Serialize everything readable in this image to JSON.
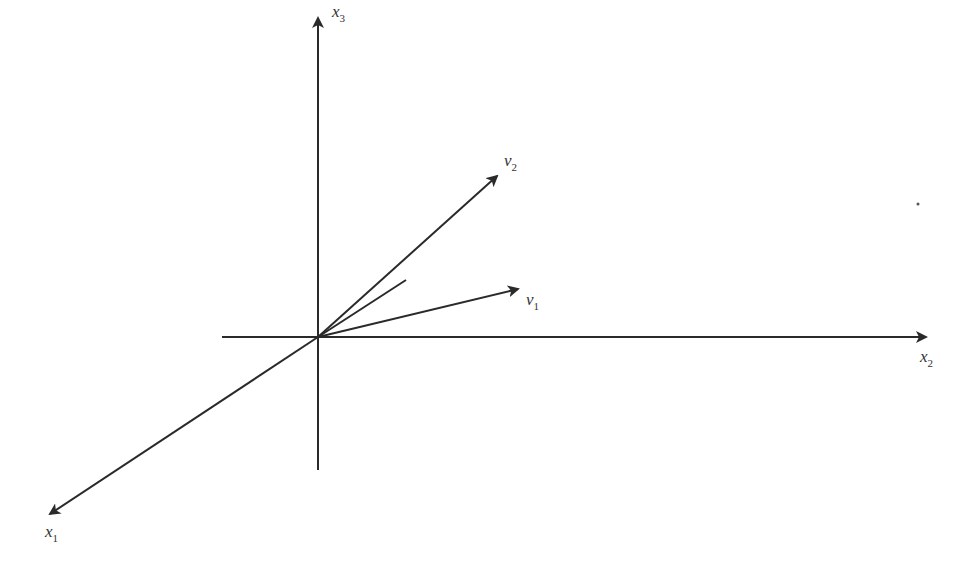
{
  "diagram": {
    "title": "",
    "axes": [
      {
        "id": "x1",
        "label": "x",
        "subscript": "1"
      },
      {
        "id": "x2",
        "label": "x",
        "subscript": "2"
      },
      {
        "id": "x3",
        "label": "x",
        "subscript": "3"
      }
    ],
    "vectors": [
      {
        "id": "v1",
        "label": "v",
        "subscript": "1"
      },
      {
        "id": "v2",
        "label": "v",
        "subscript": "2"
      }
    ],
    "colors": {
      "stroke": "#2a2a2a",
      "text": "#333333",
      "background": "#ffffff"
    }
  }
}
